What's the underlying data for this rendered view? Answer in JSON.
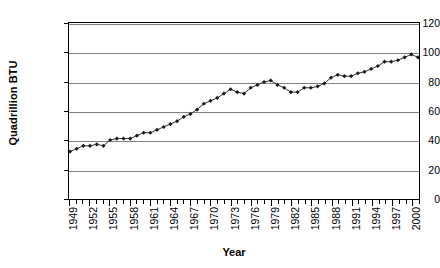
{
  "chart_data": {
    "type": "line",
    "title": "",
    "xlabel": "Year",
    "ylabel": "Quadrillion BTU",
    "ylim": [
      0,
      120
    ],
    "ytick_step": 20,
    "yticks": [
      0,
      20,
      40,
      60,
      80,
      100,
      120
    ],
    "xlim": [
      1949,
      2001
    ],
    "xtick_step": 1,
    "xlabel_step": 3,
    "xticklabels": [
      "1949",
      "1952",
      "1955",
      "1958",
      "1961",
      "1964",
      "1967",
      "1970",
      "1973",
      "1976",
      "1979",
      "1982",
      "1985",
      "1988",
      "1991",
      "1994",
      "1997",
      "2000"
    ],
    "grid": "horizontal",
    "legend": "none",
    "marker": "diamond",
    "marker_color": "#1a1a1a",
    "line_color": "#333333",
    "x": [
      1949,
      1950,
      1951,
      1952,
      1953,
      1954,
      1955,
      1956,
      1957,
      1958,
      1959,
      1960,
      1961,
      1962,
      1963,
      1964,
      1965,
      1966,
      1967,
      1968,
      1969,
      1970,
      1971,
      1972,
      1973,
      1974,
      1975,
      1976,
      1977,
      1978,
      1979,
      1980,
      1981,
      1982,
      1983,
      1984,
      1985,
      1986,
      1987,
      1988,
      1989,
      1990,
      1991,
      1992,
      1993,
      1994,
      1995,
      1996,
      1997,
      1998,
      1999,
      2000,
      2001
    ],
    "values": [
      32,
      34,
      36,
      36,
      37,
      36,
      40,
      41,
      41,
      41,
      43,
      45,
      45,
      47,
      49,
      51,
      53,
      56,
      58,
      61,
      65,
      67,
      69,
      72,
      75,
      73,
      72,
      76,
      78,
      80,
      81,
      78,
      76,
      73,
      73,
      76,
      76,
      77,
      79,
      83,
      85,
      84,
      84,
      86,
      87,
      89,
      91,
      94,
      94,
      95,
      97,
      99,
      97
    ],
    "series": [
      {
        "name": "Total Energy Consumption",
        "values": [
          32,
          34,
          36,
          36,
          37,
          36,
          40,
          41,
          41,
          41,
          43,
          45,
          45,
          47,
          49,
          51,
          53,
          56,
          58,
          61,
          65,
          67,
          69,
          72,
          75,
          73,
          72,
          76,
          78,
          80,
          81,
          78,
          76,
          73,
          73,
          76,
          76,
          77,
          79,
          83,
          85,
          84,
          84,
          86,
          87,
          89,
          91,
          94,
          94,
          95,
          97,
          99,
          97
        ]
      }
    ]
  }
}
